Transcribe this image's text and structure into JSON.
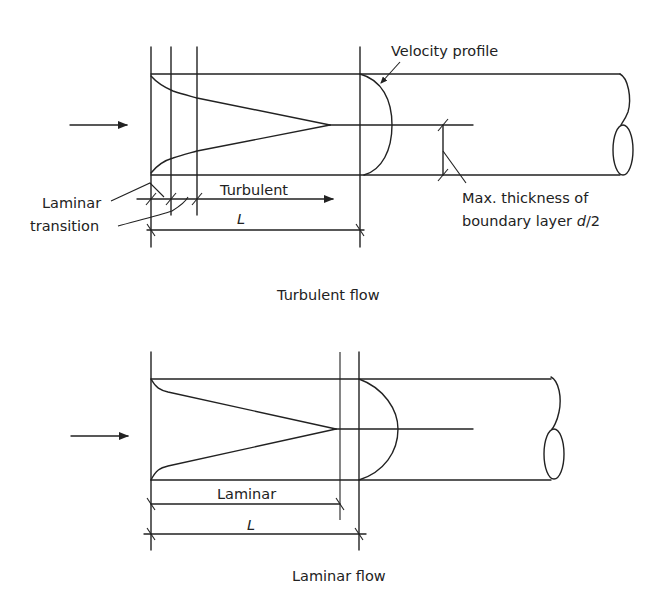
{
  "diagrams": [
    {
      "id": "turbulent",
      "caption": "Turbulent flow",
      "labels": {
        "velocity_profile": "Velocity profile",
        "laminar": "Laminar",
        "transition": "transition",
        "turbulent": "Turbulent",
        "entrance_length": "L",
        "boundary_note_line1": "Max. thickness of",
        "boundary_note_line2_prefix": "boundary layer ",
        "boundary_note_var": "d",
        "boundary_note_suffix": "/2"
      }
    },
    {
      "id": "laminar",
      "caption": "Laminar flow",
      "labels": {
        "laminar": "Laminar",
        "entrance_length": "L"
      }
    }
  ],
  "colors": {
    "stroke": "#222222",
    "background": "#ffffff"
  },
  "icons": {
    "flow_arrow": "arrow-right-icon"
  }
}
